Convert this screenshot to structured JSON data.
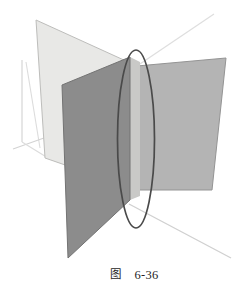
{
  "figure": {
    "title": "图 6-36",
    "caption_label": "图",
    "caption_number": "6-36",
    "background_color": "#ffffff",
    "canvas": {
      "width": 245,
      "height": 302
    }
  },
  "colors": {
    "plane_back_light": "#e8e8e6",
    "plane_back_light_edge": "#b9b9b7",
    "plane_right_mid": "#b4b4b4",
    "plane_right_mid_edge": "#8f8f8f",
    "plane_front_dark": "#8c8c8c",
    "plane_front_dark_edge": "#6f6f6f",
    "plane_strip_light": "#c9c9c7",
    "ellipse_stroke": "#4a4a4a",
    "axis_stroke": "#d2d2d2",
    "caption_text": "#262626"
  },
  "shapes": {
    "plane_back_light": {
      "name": "plane-back-light",
      "points": "36,20 137,66 137,190 45,158",
      "fill": "#e8e8e6",
      "stroke": "#b9b9b7"
    },
    "plane_right_mid": {
      "name": "plane-right-mid",
      "points": "137,66 226,58 212,190 137,190",
      "fill": "#b4b4b4",
      "stroke": "#8f8f8f"
    },
    "plane_front_dark": {
      "name": "plane-front-dark",
      "points": "62,85 130,57 130,200 68,258",
      "fill": "#8c8c8c",
      "stroke": "#6f6f6f"
    },
    "plane_strip_light": {
      "name": "plane-intersection-strip",
      "points": "130,57 139,62 139,196 130,200",
      "fill": "#c9c9c7"
    },
    "ellipse_intersection": {
      "name": "ellipse-intersection",
      "cx": 136,
      "cy": 139,
      "rx": 18.5,
      "ry": 89,
      "stroke": "#4a4a4a",
      "stroke_width": 1.7,
      "fill": "none"
    }
  },
  "axes": [
    {
      "name": "axis-vertical",
      "x1": 22,
      "y1": 60,
      "x2": 22,
      "y2": 142,
      "stroke": "#d2d2d2"
    },
    {
      "name": "axis-vertical-upper",
      "x1": 26,
      "y1": 62,
      "x2": 38,
      "y2": 144,
      "stroke": "#d8d8d8"
    },
    {
      "name": "axis-left-diagonal",
      "x1": 14,
      "y1": 148,
      "x2": 56,
      "y2": 135,
      "stroke": "#d2d2d2"
    },
    {
      "name": "axis-upper-right-diagonal",
      "x1": 137,
      "y1": 66,
      "x2": 212,
      "y2": 16,
      "stroke": "#dcdcdc"
    },
    {
      "name": "axis-lower-right-diagonal",
      "x1": 131,
      "y1": 205,
      "x2": 229,
      "y2": 257,
      "stroke": "#d2d2d2"
    },
    {
      "name": "axis-vertical-stub",
      "x1": 24,
      "y1": 140,
      "x2": 46,
      "y2": 156,
      "stroke": "#dcdcdc"
    }
  ],
  "icons": {
    "plane_icon": "plane-icon",
    "ellipse_icon": "ellipse-icon",
    "axis_icon": "axis-icon"
  }
}
